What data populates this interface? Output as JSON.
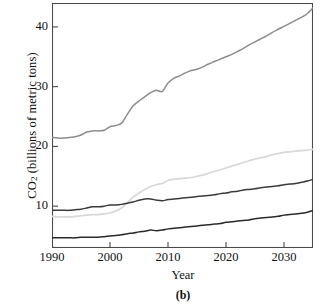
{
  "figure": {
    "caption": "(b)",
    "xlabel": "Year",
    "ylabel_main": "CO",
    "ylabel_sub": "2",
    "ylabel_rest": " (billions of metric tons)"
  },
  "axes": {
    "y_ticks": [
      {
        "value": 10,
        "label": "10"
      },
      {
        "value": 20,
        "label": "20"
      },
      {
        "value": 30,
        "label": "30"
      },
      {
        "value": 40,
        "label": "40"
      }
    ],
    "x_ticks": [
      {
        "value": 1990,
        "label": "1990"
      },
      {
        "value": 2000,
        "label": "2000"
      },
      {
        "value": 2010,
        "label": "2010"
      },
      {
        "value": 2020,
        "label": "2020"
      },
      {
        "value": 2030,
        "label": "2030"
      }
    ]
  },
  "colors": {
    "frame": "#4a4a4a",
    "series_total": "#8c8c8c",
    "series_light": "#d8d8d8",
    "series_mid": "#3a3a3a",
    "series_low": "#2a2a2a",
    "text": "#111111",
    "background": "#ffffff"
  },
  "chart_data": {
    "type": "line",
    "title": "",
    "xlabel": "Year",
    "ylabel": "CO2 (billions of metric tons)",
    "xlim": [
      1990,
      2035
    ],
    "ylim": [
      3,
      44
    ],
    "grid": false,
    "legend": "none",
    "x": [
      1990,
      1991,
      1992,
      1993,
      1994,
      1995,
      1996,
      1997,
      1998,
      1999,
      2000,
      2001,
      2002,
      2003,
      2004,
      2005,
      2006,
      2007,
      2008,
      2009,
      2010,
      2011,
      2012,
      2013,
      2014,
      2015,
      2016,
      2017,
      2018,
      2019,
      2020,
      2021,
      2022,
      2023,
      2024,
      2025,
      2026,
      2027,
      2028,
      2029,
      2030,
      2031,
      2032,
      2033,
      2034,
      2035
    ],
    "series": [
      {
        "name": "World total",
        "color": "#8c8c8c",
        "values": [
          21.5,
          21.4,
          21.4,
          21.5,
          21.6,
          21.9,
          22.4,
          22.6,
          22.6,
          22.7,
          23.3,
          23.5,
          23.9,
          25.4,
          26.8,
          27.6,
          28.3,
          29.0,
          29.4,
          29.2,
          30.6,
          31.4,
          31.8,
          32.3,
          32.7,
          32.9,
          33.3,
          33.8,
          34.2,
          34.6,
          35.0,
          35.4,
          35.9,
          36.4,
          37.0,
          37.5,
          38.0,
          38.5,
          39.1,
          39.6,
          40.1,
          40.6,
          41.1,
          41.6,
          42.2,
          43.2
        ]
      },
      {
        "name": "Non-OECD",
        "color": "#d8d8d8",
        "values": [
          8.3,
          8.2,
          8.2,
          8.2,
          8.3,
          8.4,
          8.5,
          8.6,
          8.6,
          8.7,
          8.9,
          9.2,
          9.7,
          10.6,
          11.5,
          12.2,
          12.8,
          13.3,
          13.6,
          13.8,
          14.3,
          14.5,
          14.6,
          14.7,
          14.8,
          15.0,
          15.2,
          15.5,
          15.8,
          16.1,
          16.4,
          16.7,
          17.0,
          17.3,
          17.6,
          17.9,
          18.1,
          18.3,
          18.6,
          18.8,
          19.0,
          19.1,
          19.2,
          19.3,
          19.4,
          19.5
        ]
      },
      {
        "name": "OECD",
        "color": "#3a3a3a",
        "values": [
          9.3,
          9.3,
          9.3,
          9.3,
          9.4,
          9.5,
          9.7,
          9.9,
          9.9,
          10.0,
          10.2,
          10.2,
          10.3,
          10.5,
          10.7,
          11.0,
          11.2,
          11.2,
          11.0,
          10.9,
          11.1,
          11.2,
          11.3,
          11.4,
          11.5,
          11.6,
          11.7,
          11.8,
          11.9,
          12.1,
          12.2,
          12.4,
          12.5,
          12.7,
          12.8,
          12.9,
          13.1,
          13.2,
          13.3,
          13.4,
          13.6,
          13.7,
          13.8,
          14.0,
          14.2,
          14.5
        ]
      },
      {
        "name": "Lowest series",
        "color": "#2a2a2a",
        "values": [
          4.7,
          4.7,
          4.7,
          4.7,
          4.7,
          4.8,
          4.8,
          4.8,
          4.8,
          4.9,
          5.0,
          5.1,
          5.2,
          5.4,
          5.5,
          5.7,
          5.8,
          6.0,
          5.9,
          6.0,
          6.2,
          6.3,
          6.4,
          6.5,
          6.6,
          6.7,
          6.8,
          6.9,
          7.0,
          7.1,
          7.3,
          7.4,
          7.5,
          7.6,
          7.7,
          7.9,
          8.0,
          8.1,
          8.2,
          8.3,
          8.5,
          8.6,
          8.7,
          8.8,
          9.0,
          9.3
        ]
      }
    ]
  }
}
